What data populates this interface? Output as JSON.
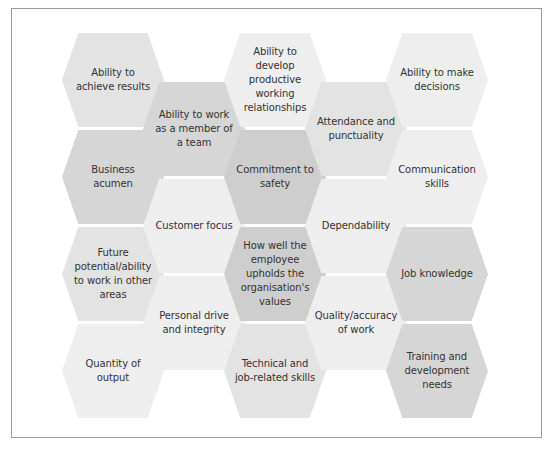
{
  "diagram": {
    "type": "hexagon-grid",
    "hexagons": [
      {
        "id": "achieve-results",
        "label": "Ability to achieve results",
        "col": 0,
        "row": 0,
        "shade": "mid"
      },
      {
        "id": "business-acumen",
        "label": "Business acumen",
        "col": 0,
        "row": 1,
        "shade": "dark"
      },
      {
        "id": "future-potential",
        "label": "Future potential/ability to work in other areas",
        "col": 0,
        "row": 2,
        "shade": "mid"
      },
      {
        "id": "quantity-output",
        "label": "Quantity of output",
        "col": 0,
        "row": 3,
        "shade": "light"
      },
      {
        "id": "work-team",
        "label": "Ability to work as a member of a team",
        "col": 1,
        "row": 0,
        "shade": "dark"
      },
      {
        "id": "customer-focus",
        "label": "Customer focus",
        "col": 1,
        "row": 1,
        "shade": "light"
      },
      {
        "id": "personal-drive",
        "label": "Personal drive and integrity",
        "col": 1,
        "row": 2,
        "shade": "light"
      },
      {
        "id": "productive-relationships",
        "label": "Ability to develop productive working relationships",
        "col": 2,
        "row": 0,
        "shade": "light"
      },
      {
        "id": "commitment-safety",
        "label": "Commitment to safety",
        "col": 2,
        "row": 1,
        "shade": "darker"
      },
      {
        "id": "organisation-values",
        "label": "How well the employee upholds the organisation's values",
        "col": 2,
        "row": 2,
        "shade": "darker"
      },
      {
        "id": "technical-skills",
        "label": "Technical and job-related skills",
        "col": 2,
        "row": 3,
        "shade": "mid"
      },
      {
        "id": "attendance",
        "label": "Attendance and punctuality",
        "col": 3,
        "row": 0,
        "shade": "mid"
      },
      {
        "id": "dependability",
        "label": "Dependability",
        "col": 3,
        "row": 1,
        "shade": "light"
      },
      {
        "id": "quality-work",
        "label": "Quality/accuracy of work",
        "col": 3,
        "row": 2,
        "shade": "light"
      },
      {
        "id": "make-decisions",
        "label": "Ability to make decisions",
        "col": 4,
        "row": 0,
        "shade": "light"
      },
      {
        "id": "communication",
        "label": "Communication skills",
        "col": 4,
        "row": 1,
        "shade": "light"
      },
      {
        "id": "job-knowledge",
        "label": "Job knowledge",
        "col": 4,
        "row": 2,
        "shade": "dark"
      },
      {
        "id": "training-needs",
        "label": "Training and development needs",
        "col": 4,
        "row": 3,
        "shade": "dark"
      }
    ]
  },
  "colors": {
    "light": "#eeeeee",
    "mid": "#e3e3e3",
    "dark": "#d6d6d6",
    "darker": "#cecece",
    "text": "#333333",
    "border": "#9a9a9a"
  }
}
